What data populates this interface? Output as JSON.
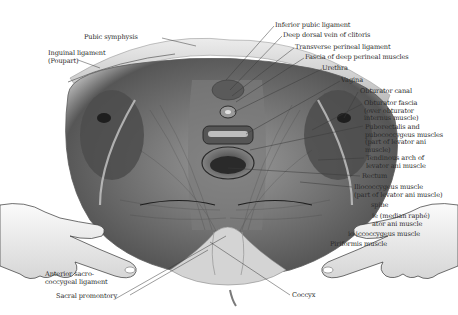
{
  "figure": {
    "type": "anatomical-illustration",
    "labels_left": [
      {
        "id": "pubic-symphysis",
        "text": "Pubic symphysis"
      },
      {
        "id": "inguinal-ligament",
        "lines": [
          "Inguinal ligament",
          "(Poupart)"
        ]
      },
      {
        "id": "anterior-sacrococcygeal-ligament",
        "lines": [
          "Anterior sacro-",
          "coccygeal ligament"
        ]
      },
      {
        "id": "sacral-promontory",
        "text": "Sacral promontory"
      }
    ],
    "labels_right": [
      {
        "id": "inferior-pubic-ligament",
        "text": "Inferior pubic ligament"
      },
      {
        "id": "deep-dorsal-vein",
        "text": "Deep dorsal vein of clitoris"
      },
      {
        "id": "transverse-perineal-ligament",
        "text": "Transverse perineal ligament"
      },
      {
        "id": "fascia-deep-perineal",
        "text": "Fascia of deep perineal muscles"
      },
      {
        "id": "urethra",
        "text": "Urethra"
      },
      {
        "id": "vagina",
        "text": "Vagina"
      },
      {
        "id": "obturator-canal",
        "text": "Obturator canal"
      },
      {
        "id": "obturator-fascia",
        "lines": [
          "Obturator fascia",
          "(over obturator",
          "internus muscle)"
        ]
      },
      {
        "id": "puborectalis",
        "lines": [
          "Puborectalis and",
          "pubococcygeus muscles",
          "(part of levator ani",
          "muscle)"
        ]
      },
      {
        "id": "tendinous-arch",
        "lines": [
          "Tendinous arch of",
          "levator ani muscle"
        ]
      },
      {
        "id": "rectum",
        "text": "Rectum"
      },
      {
        "id": "iliococcygeus",
        "lines": [
          "Iliococcygeus muscle",
          "(part of levator ani muscle)"
        ]
      },
      {
        "id": "ischial-spine",
        "text": "spine"
      },
      {
        "id": "anococcygeal-body",
        "lines": [
          "ie (median raphé)",
          "ator ani muscle"
        ]
      },
      {
        "id": "ischiococcygeus",
        "text": "io iccoccygeus muscle"
      },
      {
        "id": "piriformis",
        "text": "Piriformis muscle"
      },
      {
        "id": "coccyx",
        "text": "Coccyx"
      }
    ]
  },
  "colors": {
    "background": "#ffffff",
    "text": "#2a2a2a",
    "leader_line": "#3a3a3a",
    "muscle_dark": "#4a4a4a",
    "muscle_mid": "#8a8a8a",
    "bone_light": "#d8d8d8",
    "glove": "#f2f2f2"
  }
}
